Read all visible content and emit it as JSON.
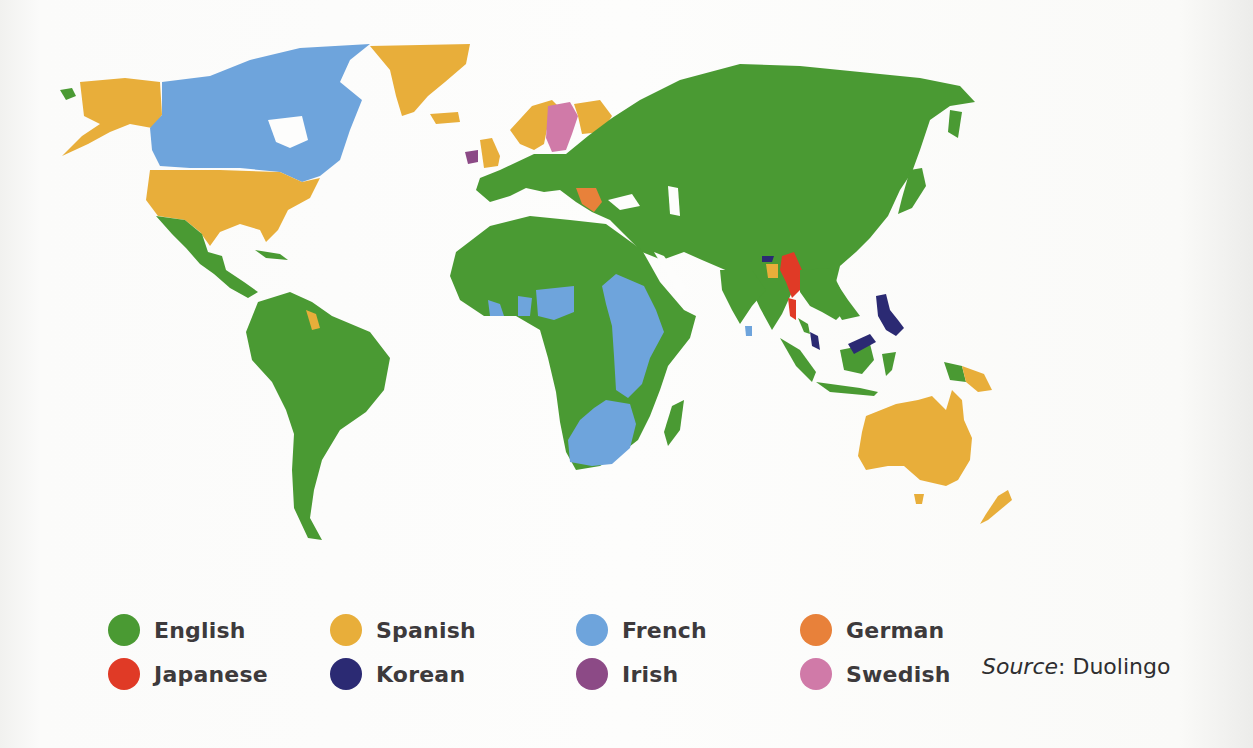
{
  "map": {
    "type": "world-choropleth",
    "subject": "Most popular language learned per country",
    "colors": {
      "English": "#4a9a33",
      "Spanish": "#e8ae3a",
      "French": "#6ea4dc",
      "German": "#e8813a",
      "Japanese": "#e03a26",
      "Korean": "#2b2a73",
      "Irish": "#8c4a86",
      "Swedish": "#d07aa8"
    },
    "regions": [
      {
        "region": "Alaska (USA)",
        "language": "Spanish"
      },
      {
        "region": "Canada",
        "language": "French"
      },
      {
        "region": "Greenland",
        "language": "Spanish"
      },
      {
        "region": "United States",
        "language": "Spanish"
      },
      {
        "region": "Mexico",
        "language": "English"
      },
      {
        "region": "Central America",
        "language": "English"
      },
      {
        "region": "South America",
        "language": "English"
      },
      {
        "region": "Suriname/Guyana",
        "language": "Spanish"
      },
      {
        "region": "Iceland",
        "language": "Spanish"
      },
      {
        "region": "United Kingdom",
        "language": "Spanish"
      },
      {
        "region": "Ireland",
        "language": "Irish"
      },
      {
        "region": "Norway",
        "language": "Spanish"
      },
      {
        "region": "Sweden",
        "language": "Swedish"
      },
      {
        "region": "Finland",
        "language": "Spanish"
      },
      {
        "region": "Balkans (Serbia area)",
        "language": "German"
      },
      {
        "region": "Europe (rest)",
        "language": "English"
      },
      {
        "region": "Russia",
        "language": "English"
      },
      {
        "region": "Middle East",
        "language": "English"
      },
      {
        "region": "North Africa",
        "language": "English"
      },
      {
        "region": "West Africa (parts)",
        "language": "French"
      },
      {
        "region": "East Africa",
        "language": "French"
      },
      {
        "region": "Southern Africa",
        "language": "French"
      },
      {
        "region": "Madagascar",
        "language": "English"
      },
      {
        "region": "India",
        "language": "English"
      },
      {
        "region": "Sri Lanka",
        "language": "French"
      },
      {
        "region": "Myanmar",
        "language": "Japanese"
      },
      {
        "region": "Bhutan",
        "language": "Korean"
      },
      {
        "region": "Bangladesh",
        "language": "Spanish"
      },
      {
        "region": "China",
        "language": "English"
      },
      {
        "region": "Japan",
        "language": "English"
      },
      {
        "region": "Southeast Asia",
        "language": "English"
      },
      {
        "region": "Malaysia",
        "language": "Korean"
      },
      {
        "region": "Philippines",
        "language": "Korean"
      },
      {
        "region": "Indonesia",
        "language": "English"
      },
      {
        "region": "Papua New Guinea",
        "language": "Spanish"
      },
      {
        "region": "Australia",
        "language": "Spanish"
      },
      {
        "region": "New Zealand",
        "language": "Spanish"
      }
    ]
  },
  "legend": {
    "items": [
      {
        "label": "English",
        "color": "#4a9a33"
      },
      {
        "label": "Spanish",
        "color": "#e8ae3a"
      },
      {
        "label": "French",
        "color": "#6ea4dc"
      },
      {
        "label": "German",
        "color": "#e8813a"
      },
      {
        "label": "Japanese",
        "color": "#e03a26"
      },
      {
        "label": "Korean",
        "color": "#2b2a73"
      },
      {
        "label": "Irish",
        "color": "#8c4a86"
      },
      {
        "label": "Swedish",
        "color": "#d07aa8"
      }
    ]
  },
  "source": {
    "prefix": "Source",
    "separator": ": ",
    "name": "Duolingo"
  }
}
